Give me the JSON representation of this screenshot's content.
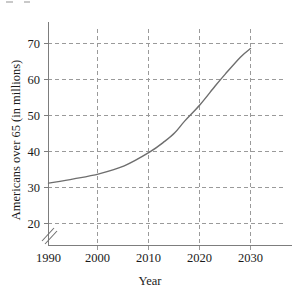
{
  "figure": {
    "background_color": "#ffffff",
    "curve_color": "#6e6e6e",
    "grid_color": "#9a9a9a",
    "axis_color": "#7d7d7d",
    "text_color": "#1a1a1a"
  },
  "chart_data": {
    "type": "line",
    "title": "",
    "subtitle": "",
    "xlabel": "Year",
    "ylabel": "Americans over 65 (in millions)",
    "xlim": [
      1990,
      2030
    ],
    "ylim": [
      15,
      74
    ],
    "grid": true,
    "grid_style": "dashed",
    "legend": null,
    "legend_position": "none",
    "axis_break": {
      "y_axis": true,
      "x_axis": true,
      "note": "double-slash break marks near origin on both axes"
    },
    "xticks": [
      1990,
      2000,
      2010,
      2020,
      2030
    ],
    "xtick_labels": [
      "1990",
      "2000",
      "2010",
      "2020",
      "2030"
    ],
    "yticks": [
      20,
      30,
      40,
      50,
      60,
      70
    ],
    "ytick_labels": [
      "20",
      "30",
      "40",
      "50",
      "60",
      "70"
    ],
    "series": [
      {
        "name": "Americans over 65",
        "x": [
          1990,
          1995,
          2000,
          2005,
          2010,
          2013,
          2015,
          2017,
          2020,
          2023,
          2025,
          2028,
          2030
        ],
        "values": [
          31.2,
          32.4,
          33.8,
          36.0,
          39.8,
          42.8,
          45.2,
          48.5,
          53.0,
          58.2,
          61.5,
          66.2,
          68.6
        ]
      }
    ]
  },
  "axis_titles": {
    "x": "Year",
    "y": "Americans over 65 (in millions)"
  }
}
